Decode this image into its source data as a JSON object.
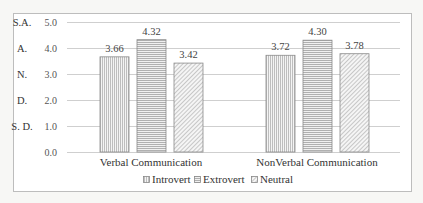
{
  "chart_data": {
    "type": "bar",
    "title": "",
    "xlabel": "",
    "ylabel": "",
    "categories": [
      "Verbal Communication",
      "NonVerbal Communication"
    ],
    "series": [
      {
        "name": "Introvert",
        "pattern": "vertical-lines",
        "values": [
          3.66,
          3.72
        ]
      },
      {
        "name": "Extrovert",
        "pattern": "horizontal-lines",
        "values": [
          4.32,
          4.3
        ]
      },
      {
        "name": "Neutral",
        "pattern": "diagonal-lines",
        "values": [
          3.42,
          3.78
        ]
      }
    ],
    "ylim": [
      0,
      5
    ],
    "yticks": [
      "0.0",
      "1.0",
      "2.0",
      "3.0",
      "4.0",
      "5.0"
    ],
    "likert_labels": [
      {
        "value": 5,
        "label": "S.A."
      },
      {
        "value": 4,
        "label": "A."
      },
      {
        "value": 3,
        "label": "N."
      },
      {
        "value": 2,
        "label": "D."
      },
      {
        "value": 1,
        "label": "S. D."
      }
    ],
    "data_labels": [
      [
        "3.66",
        "3.72"
      ],
      [
        "4.32",
        "4.30"
      ],
      [
        "3.42",
        "3.78"
      ]
    ],
    "grid": true,
    "legend_position": "bottom"
  }
}
